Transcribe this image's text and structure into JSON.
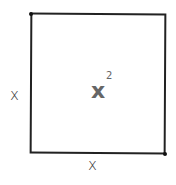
{
  "diagram": {
    "shape": "square",
    "side_left_label": "x",
    "side_bottom_label": "x",
    "area_base": "x",
    "area_exponent": "2",
    "colors": {
      "stroke": "#222222",
      "area_text": "#666666",
      "side_text": "#333333"
    }
  }
}
